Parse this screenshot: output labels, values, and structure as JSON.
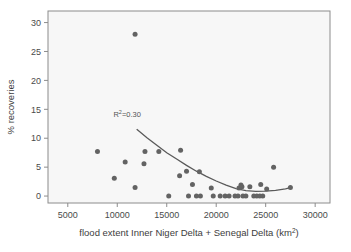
{
  "figure": {
    "background_color": "#ffffff",
    "plot_background_color": "#f7f7f7",
    "frame_color": "#8c8c8c",
    "point_color": "#636363",
    "curve_color": "#5a5a5a"
  },
  "axes": {
    "x": {
      "title_part1": "flood extent Inner Niger Delta + Senegal Delta (km",
      "title_sup": "2",
      "title_part3": ")",
      "ticks": [
        5000,
        10000,
        15000,
        20000,
        25000,
        30000
      ],
      "tick_labels": [
        "5000",
        "10000",
        "15000",
        "20000",
        "25000",
        "30000"
      ],
      "min": 3000,
      "max": 31500
    },
    "y": {
      "title": "% recoveries",
      "ticks": [
        0,
        5,
        10,
        15,
        20,
        25,
        30
      ],
      "tick_labels": [
        "0",
        "5",
        "10",
        "15",
        "20",
        "25",
        "30"
      ],
      "min": -1.2,
      "max": 32
    }
  },
  "annotations": [
    {
      "name": "r-squared-label",
      "text_part1": "R",
      "text_sup": "2",
      "text_part3": "=0.30",
      "x": 11000,
      "y": 13.6
    }
  ],
  "chart_data": {
    "type": "scatter",
    "title": "",
    "xlabel": "flood extent Inner Niger Delta + Senegal Delta (km2)",
    "ylabel": "% recoveries",
    "xlim": [
      3000,
      31500
    ],
    "ylim": [
      -1.2,
      32
    ],
    "grid": false,
    "legend": "none",
    "xticks": [
      5000,
      10000,
      15000,
      20000,
      25000,
      30000
    ],
    "yticks": [
      0,
      5,
      10,
      15,
      20,
      25,
      30
    ],
    "series": [
      {
        "name": "recoveries",
        "marker": "circle",
        "color": "#636363",
        "points": [
          [
            8000,
            7.7
          ],
          [
            9700,
            3.1
          ],
          [
            10800,
            5.9
          ],
          [
            11800,
            28.0
          ],
          [
            11800,
            1.5
          ],
          [
            12700,
            5.6
          ],
          [
            12800,
            7.7
          ],
          [
            14200,
            7.7
          ],
          [
            15200,
            0.0
          ],
          [
            16300,
            3.5
          ],
          [
            16400,
            7.9
          ],
          [
            17000,
            4.3
          ],
          [
            17200,
            0.0
          ],
          [
            17600,
            2.0
          ],
          [
            18000,
            0.0
          ],
          [
            18400,
            0.0
          ],
          [
            18300,
            4.2
          ],
          [
            19500,
            1.4
          ],
          [
            19700,
            0.0
          ],
          [
            20400,
            0.0
          ],
          [
            20900,
            0.0
          ],
          [
            21300,
            0.0
          ],
          [
            21900,
            0.0
          ],
          [
            22200,
            0.0
          ],
          [
            22300,
            1.4
          ],
          [
            22500,
            1.9
          ],
          [
            22600,
            1.6
          ],
          [
            22700,
            0.0
          ],
          [
            23000,
            0.0
          ],
          [
            23400,
            1.6
          ],
          [
            23800,
            0.0
          ],
          [
            24100,
            0.0
          ],
          [
            24400,
            0.0
          ],
          [
            24500,
            2.0
          ],
          [
            24700,
            0.0
          ],
          [
            25100,
            1.2
          ],
          [
            25800,
            5.0
          ],
          [
            27500,
            1.5
          ]
        ]
      }
    ],
    "trend_curve": {
      "name": "fitted-curve",
      "type": "quadratic",
      "color": "#5a5a5a",
      "points": [
        [
          12000,
          11.5
        ],
        [
          13000,
          10.1
        ],
        [
          14000,
          8.8
        ],
        [
          15000,
          7.5
        ],
        [
          16000,
          6.4
        ],
        [
          17000,
          5.3
        ],
        [
          18000,
          4.3
        ],
        [
          19000,
          3.4
        ],
        [
          20000,
          2.6
        ],
        [
          21000,
          1.9
        ],
        [
          22000,
          1.3
        ],
        [
          23000,
          0.95
        ],
        [
          24000,
          0.8
        ],
        [
          25000,
          0.85
        ],
        [
          26000,
          1.0
        ],
        [
          27000,
          1.25
        ],
        [
          27500,
          1.45
        ]
      ]
    },
    "annotations": [
      {
        "text": "R2=0.30",
        "x": 11000,
        "y": 13.6
      }
    ]
  }
}
